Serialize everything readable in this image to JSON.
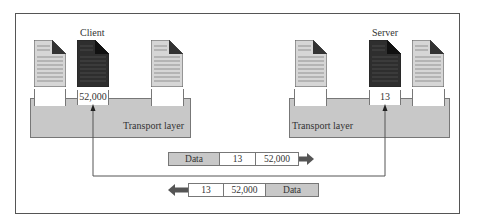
{
  "client": {
    "label": "Client",
    "transport_label": "Transport layer",
    "ports": [
      "",
      "52,000",
      ""
    ],
    "active_port_index": 1
  },
  "server": {
    "label": "Server",
    "transport_label": "Transport layer",
    "ports": [
      "",
      "13",
      ""
    ],
    "active_port_index": 1
  },
  "packets": {
    "request": {
      "direction": "right",
      "fields": [
        "Data",
        "13",
        "52,000"
      ]
    },
    "response": {
      "direction": "left",
      "fields": [
        "13",
        "52,000",
        "Data"
      ]
    }
  },
  "colors": {
    "frame": "#555555",
    "transport_fill": "#c8c8c8",
    "doc_light": "#d6d6d6",
    "doc_dark": "#2e2e2e",
    "arrow": "#555555"
  }
}
